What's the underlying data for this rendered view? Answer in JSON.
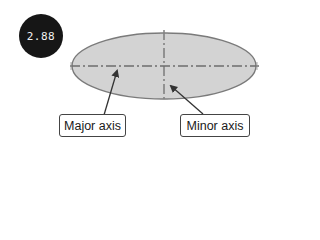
{
  "badge": {
    "value": "2.88",
    "background": "#161616",
    "text_color": "#f2f2f2"
  },
  "ellipse": {
    "cx": 164,
    "cy": 66,
    "rx": 92,
    "ry": 33,
    "fill": "#d3d3d3",
    "stroke": "#7a7a7a"
  },
  "axes": {
    "major": {
      "x1": 70,
      "y1": 66,
      "x2": 259,
      "y2": 66,
      "style": "dash-dot"
    },
    "minor": {
      "x1": 164,
      "y1": 30,
      "x2": 164,
      "y2": 102,
      "style": "dash-dot"
    }
  },
  "labels": [
    {
      "id": "major-axis",
      "text": "Major axis",
      "arrow_from": [
        104,
        115
      ],
      "arrow_to": [
        118,
        69
      ]
    },
    {
      "id": "minor-axis",
      "text": "Minor axis",
      "arrow_from": [
        203,
        114
      ],
      "arrow_to": [
        170,
        85
      ]
    }
  ]
}
